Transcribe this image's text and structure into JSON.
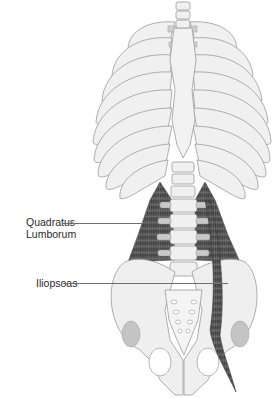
{
  "figure": {
    "colors": {
      "bone_fill": "#f0f0f0",
      "bone_stroke": "#9a9a9a",
      "cartilage": "#c8c8c8",
      "muscle_dark": "#3a3a3a",
      "muscle_mid": "#7a7a7a",
      "acetabulum": "#c4c4c4",
      "label_text": "#2a2a2a",
      "leader_line": "#6e6e6e"
    }
  },
  "labels": [
    {
      "id": "quadratus",
      "line1": "Quadratus",
      "line2": "Lumborum"
    },
    {
      "id": "iliopsoas",
      "line1": "Iliopsoas"
    }
  ]
}
